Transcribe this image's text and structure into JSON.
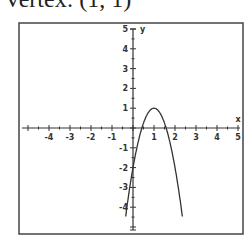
{
  "title": "Vertex: (1, 1)",
  "chart_data": {
    "type": "line",
    "title": "Vertex: (1, 1)",
    "xlabel": "x",
    "ylabel": "y",
    "xlim": [
      -5,
      5
    ],
    "ylim": [
      -5,
      5
    ],
    "x_ticks": [
      "-4",
      "-3",
      "-2",
      "-1",
      "1",
      "2",
      "3",
      "4",
      "5"
    ],
    "y_ticks": [
      "5",
      "4",
      "3",
      "2",
      "1",
      "-1",
      "-2",
      "-3",
      "-4"
    ],
    "grid": false,
    "series": [
      {
        "name": "y = -3(x-1)^2 + 1",
        "vertex": [
          1,
          1
        ],
        "y_intercept": -2,
        "x_intercepts": [
          0.42,
          1.58
        ],
        "x": [
          -0.3,
          0,
          0.42,
          0.5,
          1,
          1.5,
          1.58,
          2,
          2.3
        ],
        "y": [
          -4.07,
          -2,
          0,
          0.25,
          1,
          0.25,
          0,
          -2,
          -4.07
        ]
      }
    ]
  }
}
